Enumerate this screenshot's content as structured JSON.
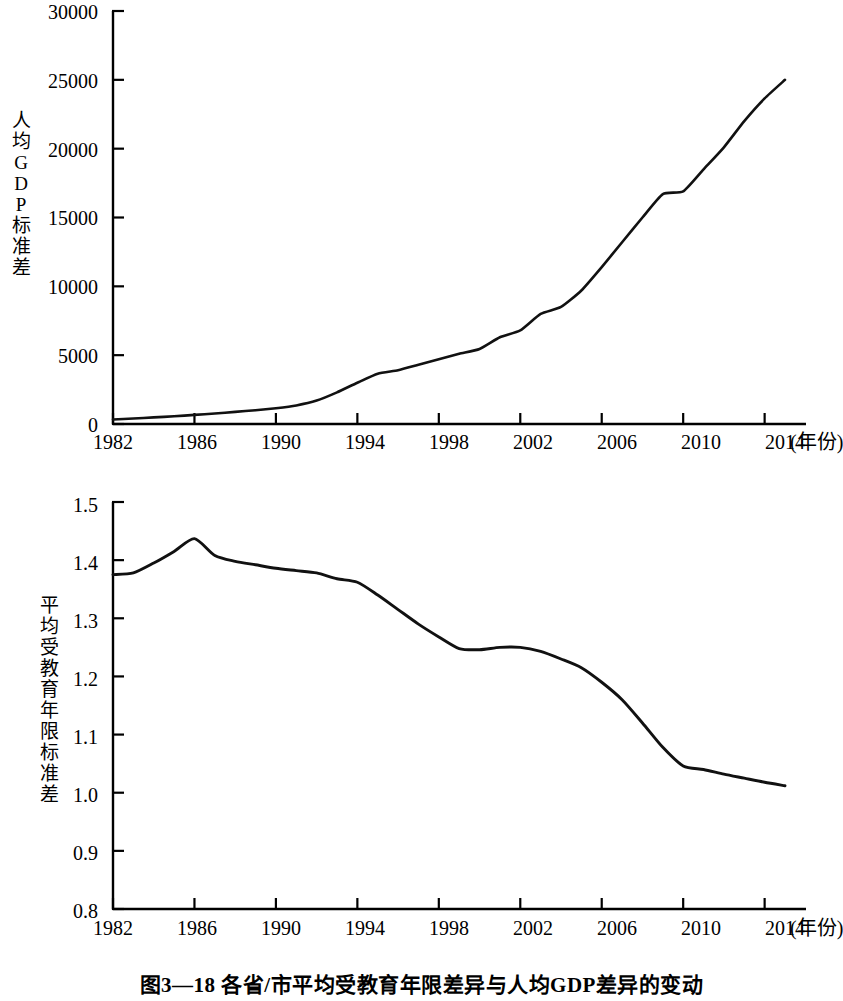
{
  "figure": {
    "caption": "图3—18  各省/市平均受教育年限差异与人均GDP差异的变动",
    "line_color": "#111111",
    "axis_color": "#000000",
    "background": "#ffffff"
  },
  "chart_data": [
    {
      "type": "line",
      "id": "per-capita-gdp-sd",
      "title": "",
      "xlabel": "(年份)",
      "ylabel": "人均GDP标准差",
      "ylabel_chars": [
        "人",
        "均",
        "G",
        "D",
        "P",
        "标",
        "准",
        "差"
      ],
      "xlim": [
        1982,
        2015
      ],
      "ylim": [
        0,
        30000
      ],
      "ytick_labels": [
        "30000",
        "25000",
        "20000",
        "15000",
        "10000",
        "5000",
        "0"
      ],
      "ytick_values": [
        30000,
        25000,
        20000,
        15000,
        10000,
        5000,
        0
      ],
      "xtick_labels": [
        "1982",
        "1986",
        "1990",
        "1994",
        "1998",
        "2002",
        "2006",
        "2010",
        "2014"
      ],
      "xtick_values": [
        1982,
        1986,
        1990,
        1994,
        1998,
        2002,
        2006,
        2010,
        2014
      ],
      "grid": false,
      "legend": "none",
      "x": [
        1982,
        1983,
        1984,
        1985,
        1986,
        1987,
        1988,
        1989,
        1990,
        1991,
        1992,
        1993,
        1994,
        1995,
        1996,
        1997,
        1998,
        1999,
        2000,
        2001,
        2002,
        2003,
        2004,
        2005,
        2006,
        2007,
        2008,
        2009,
        2010,
        2011,
        2012,
        2013,
        2014,
        2015
      ],
      "values": [
        330,
        400,
        480,
        560,
        660,
        760,
        880,
        1000,
        1150,
        1350,
        1700,
        2300,
        3000,
        3650,
        3900,
        4300,
        4700,
        5100,
        5450,
        6300,
        6800,
        8000,
        8500,
        9700,
        11400,
        13200,
        15000,
        16700,
        16900,
        18500,
        20100,
        22000,
        23650,
        25000
      ]
    },
    {
      "type": "line",
      "id": "mean-years-schooling-sd",
      "title": "",
      "xlabel": "(年份)",
      "ylabel": "平均受教育年限标准差",
      "ylabel_chars": [
        "平",
        "均",
        "受",
        "教",
        "育",
        "年",
        "限",
        "标",
        "准",
        "差"
      ],
      "xlim": [
        1982,
        2015
      ],
      "ylim": [
        0.8,
        1.5
      ],
      "ytick_labels": [
        "1.5",
        "1.4",
        "1.3",
        "1.2",
        "1.1",
        "1.0",
        "0.9",
        "0.8"
      ],
      "ytick_values": [
        1.5,
        1.4,
        1.3,
        1.2,
        1.1,
        1.0,
        0.9,
        0.8
      ],
      "xtick_labels": [
        "1982",
        "1986",
        "1990",
        "1994",
        "1998",
        "2002",
        "2006",
        "2010",
        "2014"
      ],
      "xtick_values": [
        1982,
        1986,
        1990,
        1994,
        1998,
        2002,
        2006,
        2010,
        2014
      ],
      "grid": false,
      "legend": "none",
      "x": [
        1982,
        1983,
        1984,
        1985,
        1986,
        1987,
        1988,
        1989,
        1990,
        1991,
        1992,
        1993,
        1994,
        1995,
        1996,
        1997,
        1998,
        1999,
        2000,
        2001,
        2002,
        2003,
        2004,
        2005,
        2006,
        2007,
        2008,
        2009,
        2010,
        2011,
        2012,
        2013,
        2014,
        2015
      ],
      "values": [
        1.375,
        1.378,
        1.395,
        1.415,
        1.437,
        1.408,
        1.398,
        1.392,
        1.386,
        1.382,
        1.378,
        1.368,
        1.362,
        1.34,
        1.315,
        1.29,
        1.268,
        1.248,
        1.246,
        1.25,
        1.25,
        1.243,
        1.23,
        1.215,
        1.19,
        1.16,
        1.12,
        1.078,
        1.046,
        1.04,
        1.032,
        1.025,
        1.018,
        1.012
      ]
    }
  ]
}
